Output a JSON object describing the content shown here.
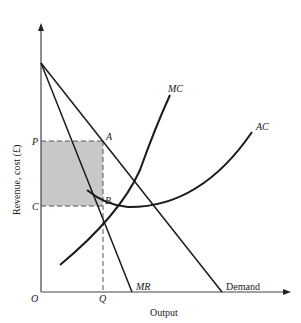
{
  "diagram": {
    "type": "economics-cost-revenue-diagram",
    "y_axis_label": "Revenue, cost (£)",
    "x_axis_label": "Output",
    "origin_label": "O",
    "price_label": "P",
    "cost_label": "C",
    "quantity_label": "Q",
    "point_a_label": "A",
    "point_b_label": "B",
    "curves": {
      "mc_label": "MC",
      "ac_label": "AC",
      "mr_label": "MR",
      "demand_label": "Demand"
    },
    "colors": {
      "line": "#1a1a1a",
      "shaded_profit_area": "#c8c8c8",
      "dashed_guides": "#555555",
      "background": "#ffffff"
    }
  }
}
